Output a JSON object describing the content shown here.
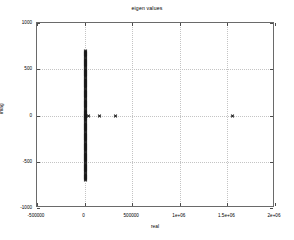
{
  "chart_data": {
    "type": "scatter",
    "title": "eigen values",
    "xlabel": "real",
    "ylabel": "imag",
    "grid": true,
    "legend": null,
    "marker": "x",
    "marker_color": "#1a1a1a",
    "xlim": [
      -500000,
      2000000
    ],
    "ylim": [
      -1000,
      1000
    ],
    "xticks": [
      -500000,
      0,
      500000,
      1000000,
      1500000,
      2000000
    ],
    "xticklabels": [
      "-500000",
      "0",
      "500000",
      "1e+06",
      "1.5e+06",
      "2e+06"
    ],
    "yticks": [
      -1000,
      -500,
      0,
      500,
      1000
    ],
    "yticklabels": [
      "-1000",
      "-500",
      "0",
      "500",
      "1000"
    ],
    "series": [
      {
        "name": "eigenvalues",
        "description": "Dense conjugate-pair cluster on the imaginary axis near real = 0, plus isolated purely real eigenvalues along imag = 0.",
        "points": [
          [
            0,
            700
          ],
          [
            0,
            688
          ],
          [
            0,
            676
          ],
          [
            0,
            664
          ],
          [
            0,
            652
          ],
          [
            0,
            640
          ],
          [
            0,
            628
          ],
          [
            0,
            616
          ],
          [
            0,
            604
          ],
          [
            0,
            592
          ],
          [
            0,
            580
          ],
          [
            0,
            568
          ],
          [
            0,
            556
          ],
          [
            0,
            544
          ],
          [
            0,
            532
          ],
          [
            0,
            520
          ],
          [
            0,
            508
          ],
          [
            0,
            496
          ],
          [
            0,
            484
          ],
          [
            0,
            472
          ],
          [
            0,
            460
          ],
          [
            0,
            448
          ],
          [
            0,
            436
          ],
          [
            0,
            424
          ],
          [
            0,
            412
          ],
          [
            0,
            400
          ],
          [
            0,
            388
          ],
          [
            0,
            376
          ],
          [
            0,
            364
          ],
          [
            0,
            352
          ],
          [
            0,
            340
          ],
          [
            0,
            328
          ],
          [
            0,
            316
          ],
          [
            0,
            304
          ],
          [
            0,
            292
          ],
          [
            0,
            280
          ],
          [
            0,
            268
          ],
          [
            0,
            256
          ],
          [
            0,
            244
          ],
          [
            0,
            232
          ],
          [
            0,
            220
          ],
          [
            0,
            208
          ],
          [
            0,
            196
          ],
          [
            0,
            184
          ],
          [
            0,
            172
          ],
          [
            0,
            160
          ],
          [
            0,
            148
          ],
          [
            0,
            136
          ],
          [
            0,
            124
          ],
          [
            0,
            112
          ],
          [
            0,
            100
          ],
          [
            0,
            88
          ],
          [
            0,
            76
          ],
          [
            0,
            64
          ],
          [
            0,
            52
          ],
          [
            0,
            40
          ],
          [
            0,
            28
          ],
          [
            0,
            16
          ],
          [
            0,
            8
          ],
          [
            0,
            0
          ],
          [
            0,
            -8
          ],
          [
            0,
            -16
          ],
          [
            0,
            -28
          ],
          [
            0,
            -40
          ],
          [
            0,
            -52
          ],
          [
            0,
            -64
          ],
          [
            0,
            -76
          ],
          [
            0,
            -88
          ],
          [
            0,
            -100
          ],
          [
            0,
            -112
          ],
          [
            0,
            -124
          ],
          [
            0,
            -136
          ],
          [
            0,
            -148
          ],
          [
            0,
            -160
          ],
          [
            0,
            -172
          ],
          [
            0,
            -184
          ],
          [
            0,
            -196
          ],
          [
            0,
            -208
          ],
          [
            0,
            -220
          ],
          [
            0,
            -232
          ],
          [
            0,
            -244
          ],
          [
            0,
            -256
          ],
          [
            0,
            -268
          ],
          [
            0,
            -280
          ],
          [
            0,
            -292
          ],
          [
            0,
            -304
          ],
          [
            0,
            -316
          ],
          [
            0,
            -328
          ],
          [
            0,
            -340
          ],
          [
            0,
            -352
          ],
          [
            0,
            -364
          ],
          [
            0,
            -376
          ],
          [
            0,
            -388
          ],
          [
            0,
            -400
          ],
          [
            0,
            -412
          ],
          [
            0,
            -424
          ],
          [
            0,
            -436
          ],
          [
            0,
            -448
          ],
          [
            0,
            -460
          ],
          [
            0,
            -472
          ],
          [
            0,
            -484
          ],
          [
            0,
            -496
          ],
          [
            0,
            -508
          ],
          [
            0,
            -520
          ],
          [
            0,
            -532
          ],
          [
            0,
            -544
          ],
          [
            0,
            -556
          ],
          [
            0,
            -568
          ],
          [
            0,
            -580
          ],
          [
            0,
            -592
          ],
          [
            0,
            -604
          ],
          [
            0,
            -616
          ],
          [
            0,
            -628
          ],
          [
            0,
            -640
          ],
          [
            0,
            -652
          ],
          [
            0,
            -664
          ],
          [
            0,
            -676
          ],
          [
            0,
            -688
          ],
          [
            0,
            -700
          ],
          [
            40000,
            0
          ],
          [
            150000,
            0
          ],
          [
            320000,
            0
          ],
          [
            1550000,
            0
          ]
        ]
      }
    ]
  }
}
